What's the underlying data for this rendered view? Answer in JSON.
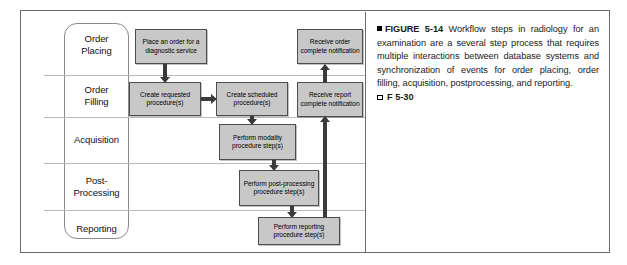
{
  "figure": {
    "frame_border_color": "#6b6b6b",
    "box_fill_color": "#c8c8c8",
    "arrow_color": "#3a3a3a"
  },
  "diagram": {
    "lanes": [
      {
        "id": "order-placing",
        "label": "Order\nPlacing"
      },
      {
        "id": "order-filling",
        "label": "Order\nFilling"
      },
      {
        "id": "acquisition",
        "label": "Acquisition"
      },
      {
        "id": "post-processing",
        "label": "Post-\nProcessing"
      },
      {
        "id": "reporting",
        "label": "Reporting"
      }
    ],
    "lane_labels": {
      "order_placing_line1": "Order",
      "order_placing_line2": "Placing",
      "order_filling_line1": "Order",
      "order_filling_line2": "Filling",
      "acquisition": "Acquisition",
      "post_processing_line1": "Post-",
      "post_processing_line2": "Processing",
      "reporting": "Reporting"
    },
    "boxes": {
      "place_order": "Place an order for a diagnostic service",
      "create_requested": "Create requested procedure(s)",
      "create_scheduled": "Create scheduled procedure(s)",
      "perform_modality": "Perform modality procedure step(s)",
      "perform_postprocessing": "Perform post-processing procedure step(s)",
      "perform_reporting": "Perform reporting procedure step(s)",
      "receive_order_complete": "Receive order complete notification",
      "receive_report_complete": "Receive report complete notification"
    }
  },
  "caption": {
    "label": "FIGURE 5-14",
    "body": " Workflow steps in radiology for an examination are a several step process that requires multiple interactions between database systems and synchronization of events for order placing, order filling, acquisition, postprocessing, and reporting.",
    "reference": "F 5-30"
  }
}
